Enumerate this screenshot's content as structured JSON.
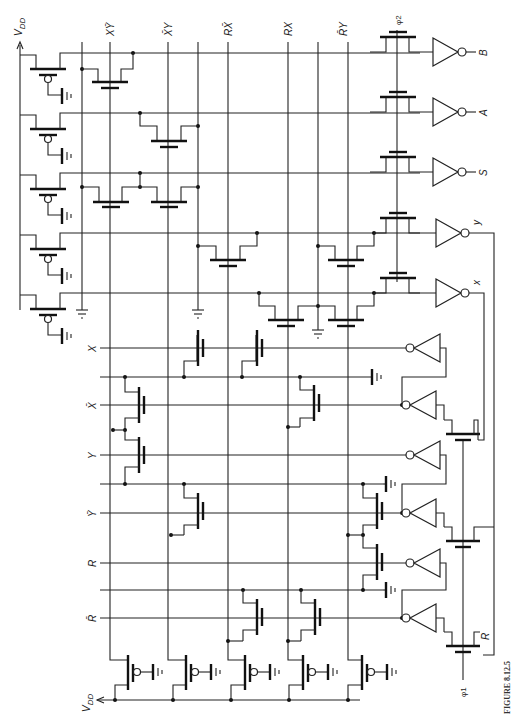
{
  "figure": {
    "caption": "FIGURE 8.12.5",
    "orientation": "rotated 90° clockwise"
  },
  "supply": {
    "vdd_top_label": "V",
    "vdd_top_sub": "DD",
    "vdd_bottom_label": "V",
    "vdd_bottom_sub": "DD"
  },
  "product_terms": [
    {
      "id": "xy_bar",
      "label": "XȲ",
      "x": 110
    },
    {
      "id": "x_bar_y",
      "label": "X̄Y",
      "x": 168
    },
    {
      "id": "r_x_bar",
      "label": "RX̄",
      "x": 228
    },
    {
      "id": "r_x",
      "label": "RX",
      "x": 288
    },
    {
      "id": "r_bar_y",
      "label": "R̄Y",
      "x": 343
    }
  ],
  "clocks": {
    "phi2": "φ2",
    "phi1": "φ1"
  },
  "outputs": [
    {
      "id": "B",
      "label": "B",
      "y": 52
    },
    {
      "id": "A",
      "label": "A",
      "y": 112
    },
    {
      "id": "S",
      "label": "S",
      "y": 172
    },
    {
      "id": "y",
      "label": "y",
      "y": 232
    },
    {
      "id": "x",
      "label": "x",
      "y": 292
    }
  ],
  "inputs": [
    {
      "id": "X",
      "label": "X",
      "y": 348
    },
    {
      "id": "X_bar",
      "label": "X̄",
      "y": 405
    },
    {
      "id": "Y",
      "label": "Y",
      "y": 455
    },
    {
      "id": "Y_bar",
      "label": "Ȳ",
      "y": 513
    },
    {
      "id": "R",
      "label": "R",
      "y": 563
    },
    {
      "id": "R_bar",
      "label": "R̄",
      "y": 618
    }
  ],
  "latch_input_label": "R",
  "colors": {
    "ink": "#222222",
    "background": "#ffffff"
  }
}
